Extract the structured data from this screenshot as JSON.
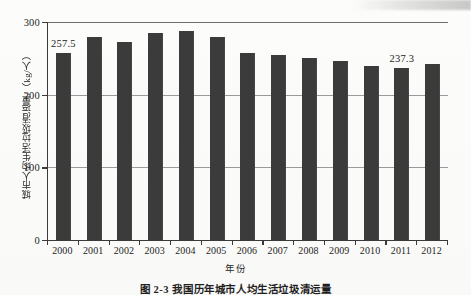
{
  "figure": {
    "caption": "图 2-3   我国历年城市人均生活垃圾清运量"
  },
  "chart_data": {
    "type": "bar",
    "title": "",
    "xlabel": "年份",
    "ylabel": "城市人均生活垃圾清运量/（kg/人）",
    "ylim": [
      0,
      300
    ],
    "yticks": [
      0,
      100,
      200,
      300
    ],
    "ytick_labels": [
      "0",
      "100",
      "200",
      "300"
    ],
    "grid": true,
    "legend": "none",
    "bar_color": "#3b3b3b",
    "categories": [
      "2000",
      "2001",
      "2002",
      "2003",
      "2004",
      "2005",
      "2006",
      "2007",
      "2008",
      "2009",
      "2010",
      "2011",
      "2012"
    ],
    "values": [
      257.5,
      280.0,
      273.0,
      285.0,
      288.0,
      279.0,
      257.0,
      254.0,
      251.0,
      247.0,
      239.0,
      237.3,
      242.0
    ],
    "point_labels": [
      {
        "category": "2000",
        "text": "257.5"
      },
      {
        "category": "2011",
        "text": "237.3"
      }
    ]
  }
}
